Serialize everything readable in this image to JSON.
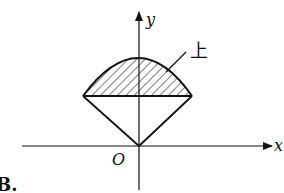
{
  "figure": {
    "label": "B.",
    "axes": {
      "x_label": "x",
      "y_label": "y",
      "origin_label": "O"
    },
    "regions": [
      {
        "name": "upper-cap",
        "label": "上",
        "shape": "circular-segment above chord",
        "fill": "hatched"
      },
      {
        "name": "lower-triangle",
        "shape": "triangle with apex at origin",
        "fill": "none"
      }
    ],
    "colors": {
      "stroke": "#111111",
      "background": "#ffffff"
    }
  }
}
